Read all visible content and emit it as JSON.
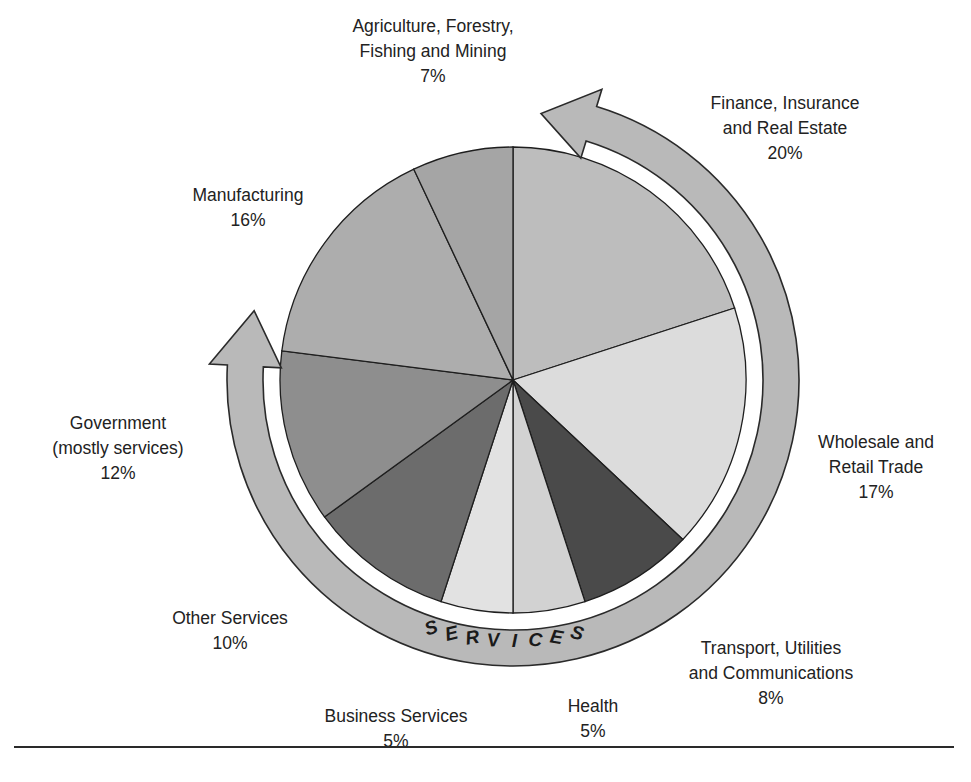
{
  "chart_data": {
    "type": "pie",
    "title": "",
    "start_angle_deg": 0,
    "direction": "clockwise",
    "slices": [
      {
        "label": "Finance, Insurance and Real Estate",
        "value": 20,
        "color": "#bdbdbd"
      },
      {
        "label": "Wholesale and Retail Trade",
        "value": 17,
        "color": "#dcdcdc"
      },
      {
        "label": "Transport, Utilities and Communications",
        "value": 8,
        "color": "#4a4a4a"
      },
      {
        "label": "Health",
        "value": 5,
        "color": "#d2d2d2"
      },
      {
        "label": "Business Services",
        "value": 5,
        "color": "#e2e2e2"
      },
      {
        "label": "Other Services",
        "value": 10,
        "color": "#6c6c6c"
      },
      {
        "label": "Government (mostly services)",
        "value": 12,
        "color": "#8e8e8e"
      },
      {
        "label": "Manufacturing",
        "value": 16,
        "color": "#adadad"
      },
      {
        "label": "Agriculture, Forestry, Fishing and Mining",
        "value": 7,
        "color": "#a5a5a5"
      }
    ],
    "annotation": {
      "text": "SERVICES",
      "arc_from": "Finance, Insurance and Real Estate",
      "arc_to": "Government (mostly services)"
    }
  },
  "labels": {
    "agriculture": {
      "lines": [
        "Agriculture, Forestry,",
        "Fishing and Mining"
      ],
      "pct": "7%"
    },
    "finance": {
      "lines": [
        "Finance, Insurance",
        "and Real Estate"
      ],
      "pct": "20%"
    },
    "manufacturing": {
      "lines": [
        "Manufacturing"
      ],
      "pct": "16%"
    },
    "government": {
      "lines": [
        "Government",
        "(mostly services)"
      ],
      "pct": "12%"
    },
    "wholesale": {
      "lines": [
        "Wholesale and",
        "Retail Trade"
      ],
      "pct": "17%"
    },
    "other": {
      "lines": [
        "Other Services"
      ],
      "pct": "10%"
    },
    "transport": {
      "lines": [
        "Transport, Utilities",
        "and Communications"
      ],
      "pct": "8%"
    },
    "business": {
      "lines": [
        "Business Services"
      ],
      "pct": "5%"
    },
    "health": {
      "lines": [
        "Health"
      ],
      "pct": "5%"
    }
  },
  "services_band": {
    "text": "SERVICES",
    "fill": "#b9b9b9",
    "stroke": "#2a2a2a"
  }
}
